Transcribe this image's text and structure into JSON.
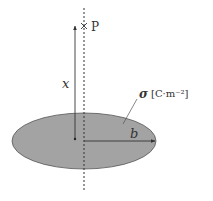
{
  "diagram": {
    "type": "charged-disk-field-point",
    "labels": {
      "point": "P",
      "distance": "x",
      "charge_density": "σ",
      "units": "[C·m⁻²]",
      "radius": "b"
    },
    "colors": {
      "disk_fill": "#a3a3a3",
      "disk_stroke": "#555555",
      "line": "#333333",
      "background": "#ffffff"
    }
  }
}
